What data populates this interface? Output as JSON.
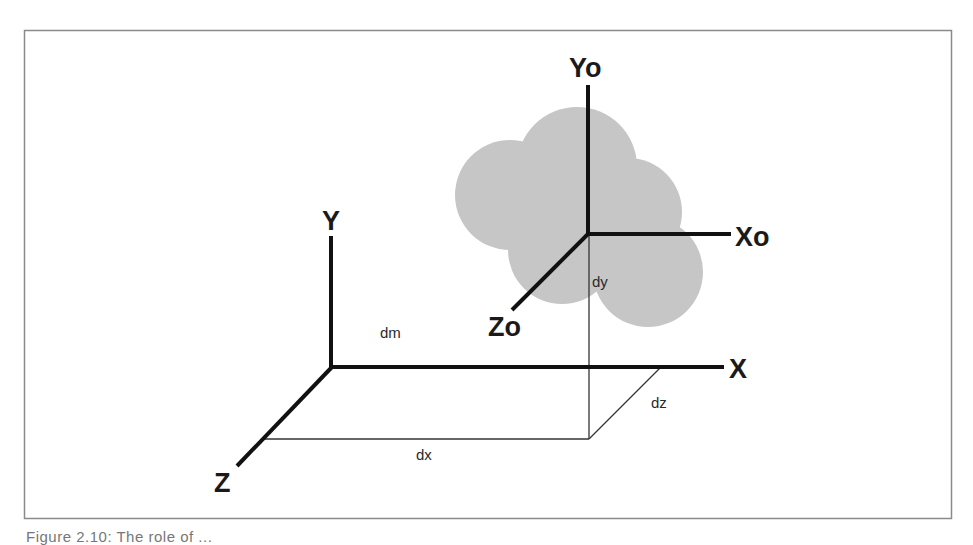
{
  "diagram": {
    "type": "3d-coordinate-frames",
    "colors": {
      "frame_border": "#8a8a8a",
      "axis": "#111111",
      "guide_line": "#333333",
      "object_fill": "#c6c6c6"
    },
    "world_axes": {
      "y_label": "Y",
      "x_label": "X",
      "z_label": "Z"
    },
    "object_axes": {
      "y_label": "Yo",
      "x_label": "Xo",
      "z_label": "Zo"
    },
    "dimensions": {
      "dm": "dm",
      "dx": "dx",
      "dy": "dy",
      "dz": "dz"
    }
  },
  "caption": "Figure 2.10: The role of ..."
}
